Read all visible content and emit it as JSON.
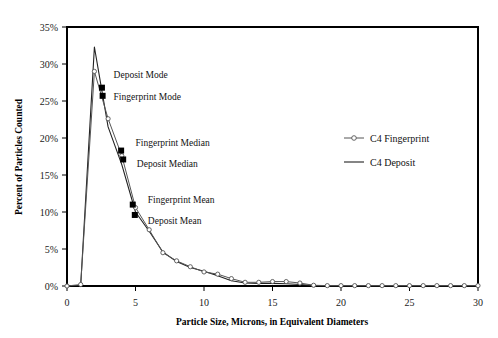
{
  "chart_data": {
    "type": "line",
    "title": "",
    "xlabel": "Particle Size, Microns, in Equivalent Diameters",
    "ylabel": "Percent of Particles Counted",
    "xlim": [
      0,
      30
    ],
    "ylim": [
      0,
      35
    ],
    "xticks": [
      0,
      5,
      10,
      15,
      20,
      25,
      30
    ],
    "xtick_labels": [
      "0",
      "5",
      "10",
      "15",
      "20",
      "25",
      "30"
    ],
    "yticks": [
      0,
      5,
      10,
      15,
      20,
      25,
      30,
      35
    ],
    "ytick_labels": [
      "0%",
      "5%",
      "10%",
      "15%",
      "20%",
      "25%",
      "30%",
      "35%"
    ],
    "grid": false,
    "legend_position": "upper right",
    "series": [
      {
        "name": "C4 Fingerprint",
        "marker": "open-circle",
        "x": [
          0,
          1,
          2,
          3,
          4,
          5,
          6,
          7,
          8,
          9,
          10,
          11,
          12,
          13,
          14,
          15,
          16,
          17,
          18,
          19,
          20,
          21,
          22,
          23,
          24,
          25,
          26,
          27,
          28,
          29,
          30
        ],
        "y": [
          0.0,
          0.2,
          29.0,
          22.6,
          17.6,
          10.6,
          7.6,
          4.5,
          3.4,
          2.6,
          1.9,
          1.6,
          1.0,
          0.5,
          0.5,
          0.6,
          0.6,
          0.4,
          0.1,
          0.05,
          0.05,
          0.05,
          0.05,
          0.05,
          0.05,
          0.05,
          0.05,
          0.05,
          0.05,
          0.05,
          0.05
        ]
      },
      {
        "name": "C4 Deposit",
        "marker": "none",
        "x": [
          0,
          1,
          2,
          3,
          4,
          5,
          6,
          7,
          8,
          9,
          10,
          11,
          12,
          13,
          14,
          15,
          16,
          17,
          18,
          19,
          20,
          21,
          22,
          23,
          24,
          25,
          26,
          27,
          28,
          29,
          30
        ],
        "y": [
          0.0,
          0.1,
          32.3,
          21.5,
          16.4,
          10.0,
          7.4,
          4.6,
          3.3,
          2.5,
          2.0,
          1.4,
          0.7,
          0.4,
          0.35,
          0.35,
          0.3,
          0.2,
          0.05,
          0.05,
          0.05,
          0.05,
          0.05,
          0.05,
          0.05,
          0.05,
          0.05,
          0.05,
          0.05,
          0.05,
          0.05
        ]
      }
    ],
    "annotations": [
      {
        "label": "Deposit Mode",
        "marker_x": 2.55,
        "marker_y": 26.8,
        "text_x": 3.4,
        "text_y": 28.6
      },
      {
        "label": "Fingerprint Mode",
        "marker_x": 2.6,
        "marker_y": 25.7,
        "text_x": 3.4,
        "text_y": 25.6
      },
      {
        "label": "Fingerprint Median",
        "marker_x": 3.95,
        "marker_y": 18.3,
        "text_x": 5.0,
        "text_y": 19.4
      },
      {
        "label": "Deposit Median",
        "marker_x": 4.1,
        "marker_y": 17.1,
        "text_x": 5.1,
        "text_y": 16.5
      },
      {
        "label": "Fingerprint Mean",
        "marker_x": 4.8,
        "marker_y": 11.0,
        "text_x": 5.9,
        "text_y": 11.7
      },
      {
        "label": "Deposit Mean",
        "marker_x": 4.95,
        "marker_y": 9.6,
        "text_x": 5.9,
        "text_y": 8.9
      }
    ],
    "colors": {
      "axis": "#000000",
      "fingerprint_line": "#555555",
      "deposit_line": "#222222",
      "marker_fill": "#ffffff",
      "annotation_marker": "#000000",
      "background": "#ffffff"
    }
  }
}
